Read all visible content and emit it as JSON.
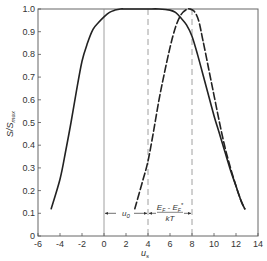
{
  "chart_data": {
    "type": "line",
    "title": "",
    "xlabel": "u_s",
    "ylabel": "S/S_max",
    "xlim": [
      -6,
      14
    ],
    "ylim": [
      0,
      1.0
    ],
    "xticks": [
      -6,
      -4,
      -2,
      0,
      2,
      4,
      6,
      8,
      10,
      12,
      14
    ],
    "yticks": [
      0,
      0.1,
      0.2,
      0.3,
      0.4,
      0.5,
      0.6,
      0.7,
      0.8,
      0.9,
      1.0
    ],
    "xtick_labels": [
      "-6",
      "-4",
      "-2",
      "0",
      "2",
      "4",
      "6",
      "8",
      "10",
      "12",
      "14"
    ],
    "ytick_labels": [
      "0",
      "0.1",
      "0.2",
      "0.3",
      "0.4",
      "0.5",
      "0.6",
      "0.7",
      "0.8",
      "0.9",
      "1.0"
    ],
    "grid": false,
    "legend": null,
    "series": [
      {
        "name": "solid",
        "style": "solid",
        "x": [
          -4.8,
          -4.0,
          -3.5,
          -3.0,
          -2.5,
          -2.0,
          -1.5,
          -1.0,
          -0.5,
          0.0,
          0.5,
          1.0,
          1.5,
          2.0,
          3.0,
          4.0,
          5.0,
          6.0,
          6.5,
          7.0,
          7.5,
          8.0,
          8.5,
          9.0,
          9.5,
          10.0,
          10.5,
          11.0,
          11.5,
          12.0,
          12.5,
          12.8
        ],
        "y": [
          0.12,
          0.25,
          0.37,
          0.5,
          0.64,
          0.77,
          0.85,
          0.91,
          0.94,
          0.965,
          0.985,
          0.995,
          1.0,
          1.0,
          1.0,
          1.0,
          1.0,
          0.995,
          0.985,
          0.96,
          0.93,
          0.88,
          0.8,
          0.71,
          0.62,
          0.53,
          0.45,
          0.37,
          0.29,
          0.22,
          0.15,
          0.12
        ]
      },
      {
        "name": "dashed",
        "style": "dashed",
        "x": [
          2.8,
          3.5,
          4.0,
          4.5,
          5.0,
          5.5,
          6.0,
          6.5,
          7.0,
          7.5,
          7.8,
          8.2,
          8.6,
          9.0,
          9.5,
          10.0,
          10.5,
          11.0,
          11.5,
          12.0,
          12.5,
          12.8
        ],
        "y": [
          0.12,
          0.24,
          0.33,
          0.46,
          0.6,
          0.72,
          0.83,
          0.92,
          0.975,
          0.998,
          1.0,
          0.99,
          0.95,
          0.86,
          0.74,
          0.62,
          0.5,
          0.39,
          0.3,
          0.22,
          0.15,
          0.12
        ]
      }
    ],
    "reference_lines": [
      {
        "x": 0,
        "style": "solid"
      },
      {
        "x": 4,
        "style": "dashed"
      },
      {
        "x": 8,
        "style": "dashed"
      }
    ],
    "annotations": [
      {
        "text": "u_0",
        "from_x": 0,
        "to_x": 4,
        "y": 0.1
      },
      {
        "text": "(E_F - E_F*)/kT",
        "from_x": 4,
        "to_x": 8,
        "y": 0.1
      }
    ]
  },
  "labels": {
    "xlabel_main": "u",
    "xlabel_sub": "s",
    "ylabel_main": "S/S",
    "ylabel_sub": "max",
    "annot_u0_main": "u",
    "annot_u0_sub": "0",
    "annot_num": "E",
    "annot_num_sub1": "F",
    "annot_minus": " - E",
    "annot_num_sub2": "F",
    "annot_star": "*",
    "annot_den": "kT"
  }
}
